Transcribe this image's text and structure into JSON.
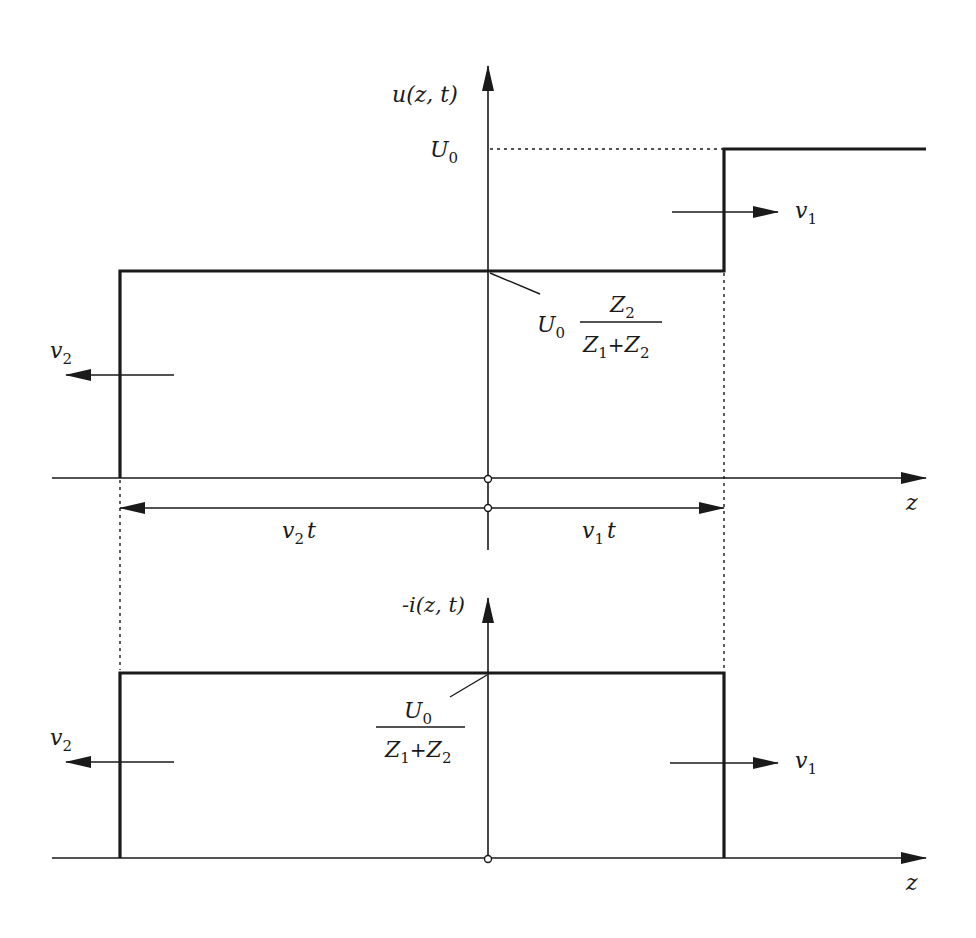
{
  "diagram": {
    "type": "transmission-line wave diagram",
    "colors": {
      "ink": "#1a1a1a",
      "background": "#ffffff"
    },
    "voltage_plot": {
      "y_axis_label": "u(z, t)",
      "level_high_label": "U",
      "level_high_sub": "0",
      "level_mid_label_prefix": "U",
      "level_mid_label_prefix_sub": "0",
      "level_mid_numerator": "Z",
      "level_mid_numerator_sub": "2",
      "level_mid_denominator_a": "Z",
      "level_mid_denominator_a_sub": "1",
      "level_mid_denominator_plus": "+",
      "level_mid_denominator_b": "Z",
      "level_mid_denominator_b_sub": "2",
      "right_wave_label": "v",
      "right_wave_sub": "1",
      "left_wave_label": "v",
      "left_wave_sub": "2",
      "x_axis_label": "z"
    },
    "distance_markers": {
      "left_label": "v",
      "left_sub": "2",
      "left_suffix": "t",
      "right_label": "v",
      "right_sub": "1",
      "right_suffix": "t"
    },
    "current_plot": {
      "y_axis_label": "-i(z, t)",
      "level_numerator": "U",
      "level_numerator_sub": "0",
      "level_denominator_a": "Z",
      "level_denominator_a_sub": "1",
      "level_denominator_plus": "+",
      "level_denominator_b": "Z",
      "level_denominator_b_sub": "2",
      "right_wave_label": "v",
      "right_wave_sub": "1",
      "left_wave_label": "v",
      "left_wave_sub": "2",
      "x_axis_label": "z"
    }
  }
}
